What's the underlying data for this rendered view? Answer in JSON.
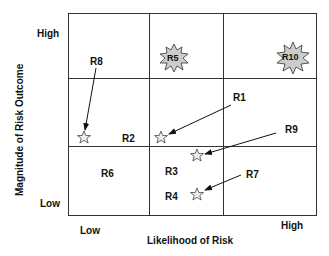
{
  "axes": {
    "x_label": "Likelihood of Risk",
    "y_label": "Magnitude of Risk Outcome",
    "x_low": "Low",
    "x_high": "High",
    "y_low": "Low",
    "y_high": "High"
  },
  "grid": {
    "rows": 3,
    "cols": 3,
    "line_color": "#333333"
  },
  "risks": {
    "r1": "R1",
    "r2": "R2",
    "r3": "R3",
    "r4": "R4",
    "r5": "R5",
    "r6": "R6",
    "r7": "R7",
    "r8": "R8",
    "r9": "R9",
    "r10": "R10"
  },
  "markers": {
    "star_color": "#dddddd",
    "burst_color": "#cccccc"
  }
}
